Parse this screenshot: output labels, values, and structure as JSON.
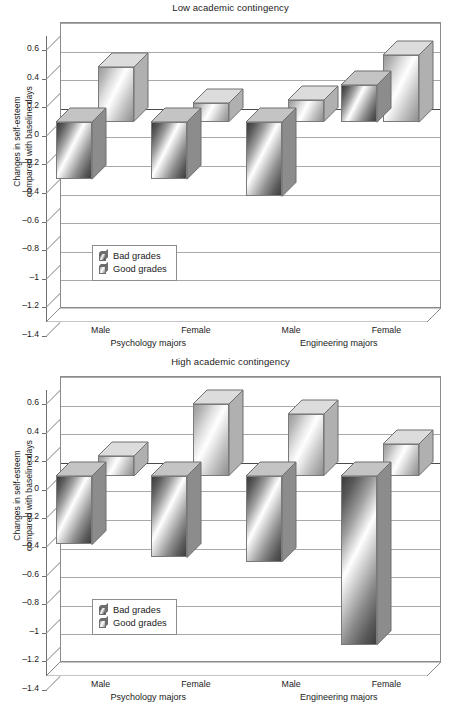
{
  "figure": {
    "panels": [
      {
        "key": "low",
        "title": "Low academic contingency"
      },
      {
        "key": "high",
        "title": "High academic contingency"
      }
    ],
    "ylabel_line1": "Changes in self-esteem",
    "ylabel_line2": "compared with baseline days",
    "ytick_labels": [
      "0.6",
      "0.4",
      "0.2",
      "0",
      "–0.2",
      "–0.4",
      "–0.6",
      "–0.8",
      "–1",
      "–1.2",
      "–1.4"
    ],
    "ytick_values": [
      0.6,
      0.4,
      0.2,
      0,
      -0.2,
      -0.4,
      -0.6,
      -0.8,
      -1,
      -1.2,
      -1.4
    ],
    "x_tick_labels": [
      "Male",
      "Female",
      "Male",
      "Female"
    ],
    "group_labels": [
      "Psychology majors",
      "Engineering majors"
    ],
    "legend": {
      "entries": [
        {
          "label": "Bad grades",
          "icon": "bar-swatch-dark-icon"
        },
        {
          "label": "Good grades",
          "icon": "bar-swatch-light-icon"
        }
      ]
    },
    "colors": {
      "bad_grades_dark": "#3a3a3a",
      "bad_grades_light": "#ffffff",
      "good_grades_dark": "#8e8e8e",
      "good_grades_light": "#ffffff",
      "gridline": "#a9a9a9",
      "axis": "#6f6f6f",
      "plot_border": "#8b8b8b",
      "text": "#1b1b1b"
    }
  },
  "chart_data": [
    {
      "type": "bar",
      "title": "Low academic contingency",
      "xlabel": "",
      "ylabel": "Changes in self-esteem compared with baseline days",
      "ylim": [
        -1.4,
        0.6
      ],
      "yticks": [
        0.6,
        0.4,
        0.2,
        0,
        -0.2,
        -0.4,
        -0.6,
        -0.8,
        -1,
        -1.2,
        -1.4
      ],
      "grid": true,
      "legend_position": "lower-left",
      "categories": [
        "Male",
        "Female",
        "Male",
        "Female"
      ],
      "groups": [
        "Psychology majors",
        "Psychology majors",
        "Engineering majors",
        "Engineering majors"
      ],
      "series": [
        {
          "name": "Bad grades",
          "values": [
            -0.4,
            -0.4,
            -0.52,
            0.26
          ]
        },
        {
          "name": "Good grades",
          "values": [
            0.38,
            0.13,
            0.15,
            0.47
          ]
        }
      ]
    },
    {
      "type": "bar",
      "title": "High academic contingency",
      "xlabel": "",
      "ylabel": "Changes in self-esteem compared with baseline days",
      "ylim": [
        -1.4,
        0.6
      ],
      "yticks": [
        0.6,
        0.4,
        0.2,
        0,
        -0.2,
        -0.4,
        -0.6,
        -0.8,
        -1,
        -1.2,
        -1.4
      ],
      "grid": true,
      "legend_position": "lower-left",
      "categories": [
        "Male",
        "Female",
        "Male",
        "Female"
      ],
      "groups": [
        "Psychology majors",
        "Psychology majors",
        "Engineering majors",
        "Engineering majors"
      ],
      "series": [
        {
          "name": "Bad grades",
          "values": [
            -0.48,
            -0.57,
            -0.6,
            -1.18
          ]
        },
        {
          "name": "Good grades",
          "values": [
            0.14,
            0.5,
            0.43,
            0.22
          ]
        }
      ]
    }
  ]
}
